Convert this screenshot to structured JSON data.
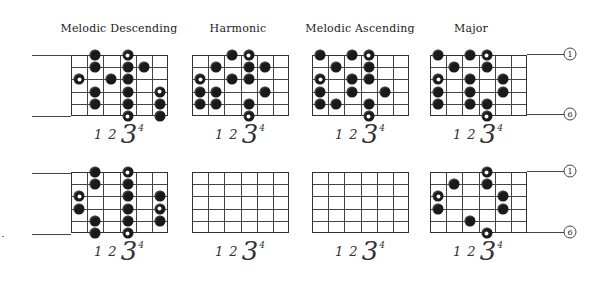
{
  "titles": [
    "Melodic Descending",
    "Harmonic",
    "Melodic Ascending",
    "Major"
  ],
  "fingering": {
    "f1": "1",
    "f2": "2",
    "f3": "3",
    "f4": "4"
  },
  "string_labels": {
    "top": "1",
    "bottom": "6"
  },
  "colors": {
    "ink": "#1a1a1a",
    "line": "#444444",
    "background": "#ffffff"
  },
  "grid_spec": {
    "strings": 6,
    "frets": 6
  },
  "diagrams": [
    {
      "id": "melodic-descending-top",
      "row": 0,
      "col": 0,
      "dots": [
        {
          "s": 1,
          "f": 2,
          "open": false
        },
        {
          "s": 1,
          "f": 4,
          "open": true
        },
        {
          "s": 2,
          "f": 2,
          "open": false
        },
        {
          "s": 2,
          "f": 4,
          "open": false
        },
        {
          "s": 2,
          "f": 5,
          "open": false
        },
        {
          "s": 3,
          "f": 1,
          "open": true
        },
        {
          "s": 3,
          "f": 3,
          "open": false
        },
        {
          "s": 3,
          "f": 4,
          "open": false
        },
        {
          "s": 4,
          "f": 2,
          "open": false
        },
        {
          "s": 4,
          "f": 4,
          "open": false
        },
        {
          "s": 4,
          "f": 6,
          "open": true
        },
        {
          "s": 5,
          "f": 2,
          "open": false
        },
        {
          "s": 5,
          "f": 4,
          "open": false
        },
        {
          "s": 5,
          "f": 6,
          "open": false
        },
        {
          "s": 6,
          "f": 4,
          "open": true
        },
        {
          "s": 6,
          "f": 6,
          "open": false
        }
      ]
    },
    {
      "id": "harmonic-top",
      "row": 0,
      "col": 1,
      "dots": [
        {
          "s": 1,
          "f": 3,
          "open": false
        },
        {
          "s": 1,
          "f": 4,
          "open": true
        },
        {
          "s": 2,
          "f": 2,
          "open": false
        },
        {
          "s": 2,
          "f": 4,
          "open": false
        },
        {
          "s": 2,
          "f": 5,
          "open": false
        },
        {
          "s": 3,
          "f": 1,
          "open": true
        },
        {
          "s": 3,
          "f": 3,
          "open": false
        },
        {
          "s": 3,
          "f": 4,
          "open": false
        },
        {
          "s": 4,
          "f": 1,
          "open": false
        },
        {
          "s": 4,
          "f": 2,
          "open": false
        },
        {
          "s": 4,
          "f": 5,
          "open": false
        },
        {
          "s": 5,
          "f": 1,
          "open": false
        },
        {
          "s": 5,
          "f": 2,
          "open": false
        },
        {
          "s": 5,
          "f": 4,
          "open": false
        },
        {
          "s": 6,
          "f": 4,
          "open": true
        }
      ]
    },
    {
      "id": "melodic-ascending-top",
      "row": 0,
      "col": 2,
      "dots": [
        {
          "s": 1,
          "f": 1,
          "open": false
        },
        {
          "s": 1,
          "f": 3,
          "open": false
        },
        {
          "s": 1,
          "f": 4,
          "open": true
        },
        {
          "s": 2,
          "f": 2,
          "open": false
        },
        {
          "s": 2,
          "f": 4,
          "open": false
        },
        {
          "s": 3,
          "f": 1,
          "open": true
        },
        {
          "s": 3,
          "f": 3,
          "open": false
        },
        {
          "s": 3,
          "f": 4,
          "open": false
        },
        {
          "s": 4,
          "f": 1,
          "open": false
        },
        {
          "s": 4,
          "f": 3,
          "open": false
        },
        {
          "s": 4,
          "f": 5,
          "open": false
        },
        {
          "s": 5,
          "f": 1,
          "open": false
        },
        {
          "s": 5,
          "f": 2,
          "open": false
        },
        {
          "s": 5,
          "f": 4,
          "open": false
        },
        {
          "s": 6,
          "f": 4,
          "open": true
        }
      ]
    },
    {
      "id": "major-top",
      "row": 0,
      "col": 3,
      "dots": [
        {
          "s": 1,
          "f": 1,
          "open": false
        },
        {
          "s": 1,
          "f": 3,
          "open": false
        },
        {
          "s": 1,
          "f": 4,
          "open": true
        },
        {
          "s": 2,
          "f": 2,
          "open": false
        },
        {
          "s": 2,
          "f": 4,
          "open": false
        },
        {
          "s": 3,
          "f": 1,
          "open": true
        },
        {
          "s": 3,
          "f": 3,
          "open": false
        },
        {
          "s": 3,
          "f": 5,
          "open": false
        },
        {
          "s": 4,
          "f": 1,
          "open": false
        },
        {
          "s": 4,
          "f": 3,
          "open": false
        },
        {
          "s": 4,
          "f": 5,
          "open": false
        },
        {
          "s": 5,
          "f": 1,
          "open": false
        },
        {
          "s": 5,
          "f": 3,
          "open": false
        },
        {
          "s": 5,
          "f": 4,
          "open": false
        },
        {
          "s": 6,
          "f": 4,
          "open": true
        }
      ]
    },
    {
      "id": "melodic-descending-bottom",
      "row": 1,
      "col": 0,
      "dots": [
        {
          "s": 1,
          "f": 2,
          "open": false
        },
        {
          "s": 1,
          "f": 4,
          "open": true
        },
        {
          "s": 2,
          "f": 2,
          "open": false
        },
        {
          "s": 2,
          "f": 4,
          "open": false
        },
        {
          "s": 3,
          "f": 1,
          "open": true
        },
        {
          "s": 3,
          "f": 4,
          "open": false
        },
        {
          "s": 3,
          "f": 6,
          "open": false
        },
        {
          "s": 4,
          "f": 1,
          "open": false
        },
        {
          "s": 4,
          "f": 4,
          "open": false
        },
        {
          "s": 4,
          "f": 6,
          "open": true
        },
        {
          "s": 5,
          "f": 2,
          "open": false
        },
        {
          "s": 5,
          "f": 4,
          "open": false
        },
        {
          "s": 5,
          "f": 6,
          "open": false
        },
        {
          "s": 6,
          "f": 2,
          "open": false
        },
        {
          "s": 6,
          "f": 4,
          "open": true
        }
      ]
    },
    {
      "id": "harmonic-bottom",
      "row": 1,
      "col": 1,
      "dots": []
    },
    {
      "id": "melodic-ascending-bottom",
      "row": 1,
      "col": 2,
      "dots": []
    },
    {
      "id": "major-bottom",
      "row": 1,
      "col": 3,
      "dots": [
        {
          "s": 1,
          "f": 4,
          "open": true
        },
        {
          "s": 2,
          "f": 2,
          "open": false
        },
        {
          "s": 2,
          "f": 4,
          "open": false
        },
        {
          "s": 3,
          "f": 1,
          "open": true
        },
        {
          "s": 3,
          "f": 5,
          "open": false
        },
        {
          "s": 4,
          "f": 1,
          "open": false
        },
        {
          "s": 4,
          "f": 5,
          "open": false
        },
        {
          "s": 5,
          "f": 3,
          "open": false
        },
        {
          "s": 6,
          "f": 4,
          "open": true
        }
      ]
    }
  ]
}
